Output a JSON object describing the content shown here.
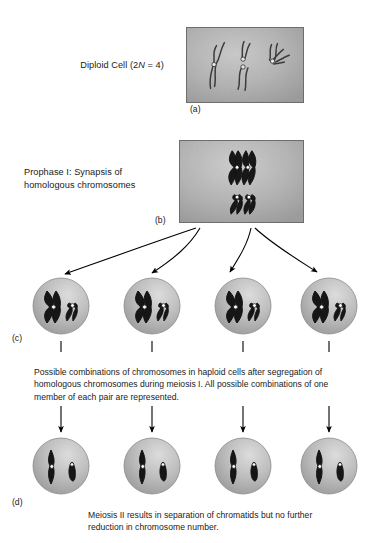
{
  "figure": {
    "title_labels": {
      "diploid_prefix": "Diploid Cell (2",
      "diploid_italic": "N",
      "diploid_suffix": " = 4)",
      "diploid_full": "Diploid Cell (2N = 4)",
      "prophase": "Prophase I: Synapsis of homologous chromosomes"
    },
    "panel_tags": {
      "a": "(a)",
      "b": "(b)",
      "c": "(c)",
      "d": "(d)"
    },
    "captions": {
      "c": "Possible combinations of chromosomes in haploid cells after segregation of homologous chromosomes during meiosis I. All possible combinations of one member of each pair are represented.",
      "d": "Meiosis II results in separation of chromatids but no further reduction in chromosome number."
    },
    "panels": {
      "a": {
        "name": "diploid-cell-micrograph",
        "description": "Grey micrograph showing four thread-like chromosomes with centromere dots",
        "chromosome_count": 4
      },
      "b": {
        "name": "prophase-one-micrograph",
        "description": "Grey micrograph showing two synapsed bivalents of homologous chromosomes",
        "bivalent_count": 2
      }
    },
    "cells_row_c": [
      {
        "label": "haploid-cell-1",
        "long_chromosome": "dark",
        "short_chromosome": "dark"
      },
      {
        "label": "haploid-cell-2",
        "long_chromosome": "dark",
        "short_chromosome": "dark"
      },
      {
        "label": "haploid-cell-3",
        "long_chromosome": "dark",
        "short_chromosome": "dark"
      },
      {
        "label": "haploid-cell-4",
        "long_chromosome": "dark",
        "short_chromosome": "dark"
      }
    ],
    "cells_row_d": [
      {
        "label": "meiosis-two-cell-1",
        "long_chromatid": "dark",
        "short_chromatid": "dark"
      },
      {
        "label": "meiosis-two-cell-2",
        "long_chromatid": "dark",
        "short_chromatid": "dark"
      },
      {
        "label": "meiosis-two-cell-3",
        "long_chromatid": "dark",
        "short_chromatid": "dark"
      },
      {
        "label": "meiosis-two-cell-4",
        "long_chromatid": "dark",
        "short_chromatid": "dark"
      }
    ],
    "colors": {
      "background": "#ffffff",
      "text": "#1a1a1a",
      "panel_border": "#6d6d6d",
      "panel_fill": "#a8a8a8",
      "cell_fill": "#b0b0b0",
      "cell_highlight": "#d8d8d8",
      "chromosome_dark": "#1a1a1a",
      "chromosome_outline": "#2a2a2a",
      "centromere": "#ffffff",
      "arrow": "#000000"
    },
    "arrow_counts": {
      "b_to_c": 4,
      "c_to_caption": 4,
      "caption_to_d": 4
    }
  }
}
